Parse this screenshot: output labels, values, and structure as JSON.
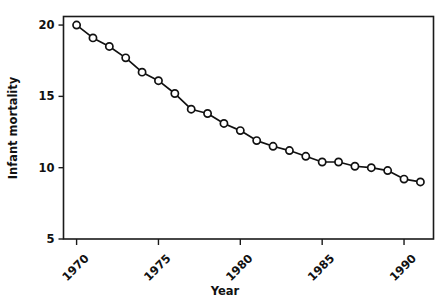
{
  "chart_data": {
    "type": "line",
    "title": "",
    "xlabel": "Year",
    "ylabel": "Infant mortality",
    "xlim": [
      1969.2,
      1991.8
    ],
    "ylim": [
      5,
      20.6
    ],
    "xticks": [
      1970,
      1975,
      1980,
      1985,
      1990
    ],
    "xtick_labels": [
      "1970",
      "1975",
      "1980",
      "1985",
      "1990"
    ],
    "yticks": [
      5,
      10,
      15,
      20
    ],
    "ytick_labels": [
      "5",
      "10",
      "15",
      "20"
    ],
    "grid": false,
    "legend": "none",
    "marker": "open-circle",
    "line_color": "#111111",
    "marker_face_color": "#ffffff",
    "x": [
      1970,
      1971,
      1972,
      1973,
      1974,
      1975,
      1976,
      1977,
      1978,
      1979,
      1980,
      1981,
      1982,
      1983,
      1984,
      1985,
      1986,
      1987,
      1988,
      1989,
      1990,
      1991
    ],
    "values": [
      20.0,
      19.1,
      18.5,
      17.7,
      16.7,
      16.1,
      15.2,
      14.1,
      13.8,
      13.1,
      12.6,
      11.9,
      11.5,
      11.2,
      10.8,
      10.4,
      10.4,
      10.1,
      10.0,
      9.8,
      9.2,
      9.0
    ],
    "series": [
      {
        "name": "Infant mortality",
        "values": [
          20.0,
          19.1,
          18.5,
          17.7,
          16.7,
          16.1,
          15.2,
          14.1,
          13.8,
          13.1,
          12.6,
          11.9,
          11.5,
          11.2,
          10.8,
          10.4,
          10.4,
          10.1,
          10.0,
          9.8,
          9.2,
          9.0
        ]
      }
    ]
  }
}
